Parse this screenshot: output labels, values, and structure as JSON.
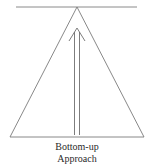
{
  "diagram": {
    "caption": {
      "line1": "Bottom-up",
      "line2": "Approach"
    },
    "shapes": {
      "top_line": {
        "x1": 16,
        "y1": 7,
        "x2": 137,
        "y2": 7
      },
      "triangle": {
        "apex": [
          77,
          7
        ],
        "base_left": [
          10,
          137
        ],
        "base_right": [
          144,
          137
        ]
      },
      "arrow": {
        "tip": [
          77,
          28
        ],
        "direction": "up",
        "shaft_bottom_y": 135
      }
    },
    "colors": {
      "stroke": "#7a7a7a",
      "text": "#2a2a2a",
      "background": "#ffffff"
    }
  }
}
